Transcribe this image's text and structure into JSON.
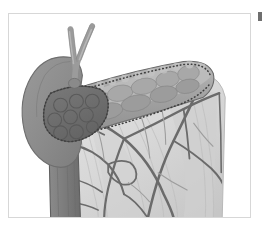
{
  "figure": {
    "caption": "",
    "type": "anatomical-illustration",
    "subject": "Pancreas, duodenum, gallbladder and mesenteric vasculature",
    "style": "grayscale line-and-wash surgical atlas drawing",
    "frame_color": "#d7d7d7",
    "background_color": "#ffffff"
  },
  "palette": {
    "liver": "#8d8d8d",
    "liver_edge": "#6e6e6e",
    "gallbladder_mass": "#6f6f6f",
    "gallbladder_edge": "#555555",
    "duodenum": "#7e7e7e",
    "duodenum_edge": "#5f5f5f",
    "pancreas": "#9a9a9a",
    "pancreas_light": "#b4b4b4",
    "pancreas_edge": "#6a6a6a",
    "mesentery": "#dcdcdc",
    "mesentery_shade": "#c9c9c9",
    "vessel": "#6b6b6b",
    "vessel_thin": "#9d9d9d",
    "duct": "#9b9b9b",
    "duct_edge": "#7a7a7a",
    "dotted_line": "#3f3f3f"
  },
  "structures": [
    {
      "id": "hepatic-duct-left",
      "label": "Left hepatic duct",
      "color": "#9b9b9b"
    },
    {
      "id": "hepatic-duct-right",
      "label": "Right hepatic duct",
      "color": "#9b9b9b"
    },
    {
      "id": "liver-lobe",
      "label": "Liver / gallbladder fundus",
      "color": "#8d8d8d"
    },
    {
      "id": "nodular-mass",
      "label": "Lobulated mass",
      "color": "#6f6f6f"
    },
    {
      "id": "pancreas-body",
      "label": "Pancreas body and tail",
      "color": "#9a9a9a"
    },
    {
      "id": "dissection-line",
      "label": "Dotted dissection line",
      "color": "#3f3f3f"
    },
    {
      "id": "duodenum",
      "label": "Duodenum",
      "color": "#7e7e7e"
    },
    {
      "id": "mesentery",
      "label": "Mesentery",
      "color": "#dcdcdc"
    },
    {
      "id": "vascular-arcade",
      "label": "Mesenteric vascular arcade",
      "color": "#6b6b6b"
    }
  ],
  "marks": {
    "crop_mark_label": "page crop mark",
    "crop_mark_color": "#6f6f6f"
  }
}
